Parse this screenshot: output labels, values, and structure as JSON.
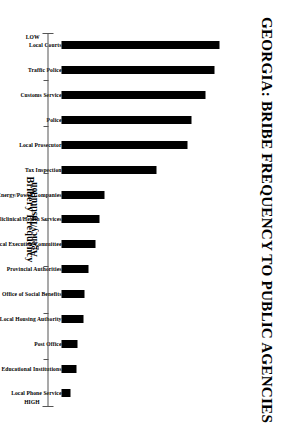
{
  "chart_data": {
    "type": "bar",
    "title": "GEORGIA:  BRIBE FREQUENCY TO PUBLIC AGENCIES",
    "xlabel": "Agency/Institution",
    "ylabel": "Bribery Frequency",
    "orientation": "vertical-bars-rotated-page",
    "grid": false,
    "legend": null,
    "ylim": [
      0,
      100
    ],
    "ytick_labels": [
      "LOW",
      "HIGH"
    ],
    "ytick_count": 9,
    "categories": [
      "Local Courts",
      "Traffic Police",
      "Customs Service",
      "Police",
      "Local Prosecutor",
      "Tax Inspection",
      "Energy/Power Companies",
      "Policlinical/Health Services",
      "Local Executive Committee",
      "Provincial Authorities",
      "Office of Social Benefits",
      "Local Housing Authority",
      "Post Office",
      "State Educational Institutions",
      "Local Phone Service"
    ],
    "values": [
      88,
      85,
      80,
      72,
      70,
      53,
      24,
      21,
      19,
      15,
      13,
      12.5,
      9,
      8.5,
      5
    ],
    "bar_color": "#000000",
    "axis_color": "#555555",
    "background": "#ffffff"
  }
}
